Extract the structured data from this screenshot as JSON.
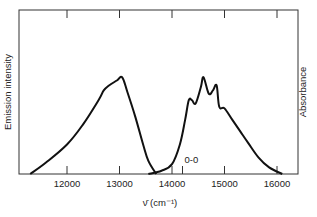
{
  "chart_data": {
    "type": "line",
    "title": "",
    "xlabel": "ν̄ (cm⁻¹)",
    "ylabel_left": "Emission intensity",
    "ylabel_right": "Absorbance",
    "xlim": [
      11200,
      16400
    ],
    "ylim": [
      0,
      1
    ],
    "xticks": [
      12000,
      13000,
      14000,
      15000,
      16000
    ],
    "xtick_labels": [
      "12000",
      "13000",
      "14000",
      "15000",
      "16000"
    ],
    "grid": false,
    "legend": null,
    "annotations": [
      {
        "text": "0-0",
        "x": 14200,
        "note": "0-0 transition marker tick"
      }
    ],
    "series": [
      {
        "name": "Emission",
        "x": [
          11300,
          11600,
          12000,
          12300,
          12600,
          12700,
          12800,
          12950,
          13050,
          13150,
          13300,
          13450,
          13550,
          13700
        ],
        "values": [
          0.0,
          0.07,
          0.18,
          0.3,
          0.45,
          0.51,
          0.54,
          0.57,
          0.59,
          0.5,
          0.35,
          0.18,
          0.08,
          0.0
        ]
      },
      {
        "name": "Absorbance",
        "x": [
          13550,
          13800,
          14000,
          14150,
          14250,
          14320,
          14380,
          14450,
          14550,
          14600,
          14700,
          14780,
          14850,
          14900,
          15000,
          15150,
          15300,
          15450,
          15650,
          15850,
          16100
        ],
        "values": [
          0.0,
          0.02,
          0.06,
          0.18,
          0.33,
          0.45,
          0.45,
          0.43,
          0.53,
          0.59,
          0.49,
          0.51,
          0.54,
          0.41,
          0.4,
          0.33,
          0.26,
          0.19,
          0.1,
          0.04,
          0.0
        ]
      }
    ]
  },
  "layout": {
    "frame": {
      "left": 19,
      "top": 10,
      "right": 298,
      "bottom": 174
    },
    "px_per_1000": 52.5,
    "x_at_12000": 67
  }
}
